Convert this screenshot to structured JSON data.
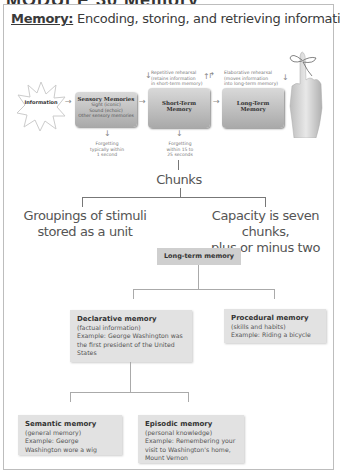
{
  "page": {
    "cut_title": "MODULE 30  Memory",
    "header": {
      "keyword": "Memory:",
      "text": " Encoding, storing, and retrieving information"
    }
  },
  "stage_model": {
    "information": "Information",
    "sensory": {
      "title": "Sensory Memories",
      "lines": [
        "Sight (iconic)",
        "Sound (echoic)",
        "Other sensory memories"
      ]
    },
    "short_term": {
      "title_1": "Short-Term",
      "title_2": "Memory"
    },
    "long_term": {
      "title_1": "Long-Term",
      "title_2": "Memory"
    },
    "repetitive_rehearsal": [
      "Repetitive rehearsal",
      "(retains information",
      "in short-term memory)"
    ],
    "elaborative_rehearsal": [
      "Elaborative rehearsal",
      "(moves information",
      "into long-term memory)"
    ],
    "forgetting_sensory": [
      "Forgetting",
      "typically within",
      "1 second"
    ],
    "forgetting_stm": [
      "Forgetting",
      "within 15 to",
      "25 seconds"
    ],
    "image": "hand-with-string-on-finger"
  },
  "chunks": {
    "title": "Chunks",
    "left": [
      "Groupings of stimuli",
      "stored as a unit"
    ],
    "right": [
      "Capacity is seven chunks,",
      "plus or minus two"
    ]
  },
  "ltm_tree": {
    "root": "Long-term memory",
    "declarative": {
      "title": "Declarative memory",
      "sub": "(factual information)",
      "example": "Example: George Washington was the first president of the United States"
    },
    "procedural": {
      "title": "Procedural memory",
      "sub": "(skills and habits)",
      "example": "Example: Riding a bicycle"
    },
    "semantic": {
      "title": "Semantic memory",
      "sub": "(general memory)",
      "example": "Example: George Washington wore a wig"
    },
    "episodic": {
      "title": "Episodic memory",
      "sub": "(personal knowledge)",
      "example": "Example: Remembering your visit to Washington's home, Mount Vernon"
    }
  }
}
